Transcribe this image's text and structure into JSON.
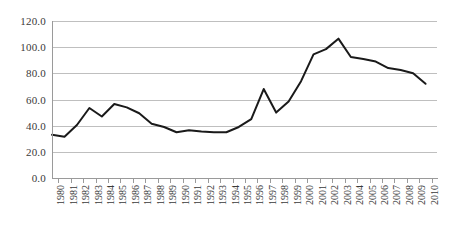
{
  "chart_data": {
    "type": "line",
    "title": "",
    "xlabel": "",
    "ylabel": "",
    "ylim": [
      0,
      120
    ],
    "ytick_step": 20,
    "grid": true,
    "legend": false,
    "legend_position": "none",
    "line_color": "#1a1a1a",
    "gridline_color": "#bfbfbf",
    "axis_color": "#9a9a9a",
    "ytick_labels": [
      "120.0",
      "100.0",
      "80.0",
      "60.0",
      "40.0",
      "20.0",
      "0.0"
    ],
    "ytick_values": [
      120,
      100,
      80,
      60,
      40,
      20,
      0
    ],
    "categories": [
      "1980",
      "1981",
      "1982",
      "1983",
      "1984",
      "1985",
      "1986",
      "1987",
      "1988",
      "1989",
      "1990",
      "1991",
      "1992",
      "1993",
      "1994",
      "1995",
      "1996",
      "1997",
      "1998",
      "1999",
      "2000",
      "2001",
      "2002",
      "2003",
      "2004",
      "2005",
      "2006",
      "2007",
      "2008",
      "2009",
      "2010"
    ],
    "values": [
      33.0,
      31.5,
      40.5,
      53.5,
      47.0,
      56.5,
      54.0,
      49.5,
      41.5,
      39.0,
      35.0,
      36.5,
      35.5,
      35.0,
      35.0,
      39.0,
      45.0,
      68.0,
      50.0,
      58.5,
      74.0,
      94.5,
      98.5,
      106.5,
      92.5,
      91.0,
      89.0,
      84.0,
      82.5,
      80.0,
      72.0
    ]
  }
}
